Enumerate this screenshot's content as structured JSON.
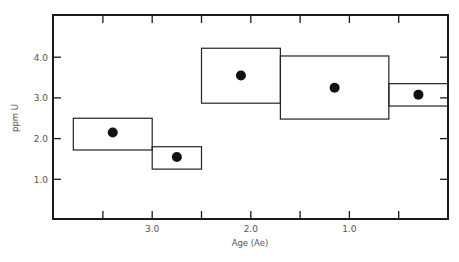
{
  "chart_data": {
    "type": "scatter",
    "title": "",
    "xlabel": "Age (Ae)",
    "ylabel": "ppm U",
    "xlim": [
      4.0,
      0.0
    ],
    "ylim": [
      0.0,
      5.0
    ],
    "x_reversed": true,
    "x_ticks": [
      3.5,
      3.0,
      2.5,
      2.0,
      1.5,
      1.0,
      0.5
    ],
    "x_tick_labels": [
      {
        "value": 3.0,
        "label": "3.0"
      },
      {
        "value": 2.0,
        "label": "2.0"
      },
      {
        "value": 1.0,
        "label": "1.0"
      }
    ],
    "y_ticks": [
      1.0,
      2.0,
      3.0,
      4.0
    ],
    "y_tick_labels": [
      {
        "value": 4.0,
        "label": "4.0"
      },
      {
        "value": 3.0,
        "label": "3.0"
      },
      {
        "value": 2.0,
        "label": "2.0"
      },
      {
        "value": 1.0,
        "label": "1.0"
      }
    ],
    "grid": false,
    "legend": null,
    "series": [
      {
        "name": "ppm U by age interval",
        "points": [
          {
            "age": 3.4,
            "ppm_u": 2.15,
            "age_range": [
              3.8,
              3.0
            ],
            "ppm_range": [
              1.72,
              2.5
            ]
          },
          {
            "age": 2.75,
            "ppm_u": 1.55,
            "age_range": [
              3.0,
              2.5
            ],
            "ppm_range": [
              1.25,
              1.8
            ]
          },
          {
            "age": 2.1,
            "ppm_u": 3.55,
            "age_range": [
              2.5,
              1.7
            ],
            "ppm_range": [
              2.87,
              4.22
            ]
          },
          {
            "age": 1.15,
            "ppm_u": 3.25,
            "age_range": [
              1.7,
              0.6
            ],
            "ppm_range": [
              2.48,
              4.03
            ]
          },
          {
            "age": 0.3,
            "ppm_u": 3.08,
            "age_range": [
              0.6,
              0.0
            ],
            "ppm_range": [
              2.8,
              3.35
            ]
          }
        ]
      }
    ]
  }
}
